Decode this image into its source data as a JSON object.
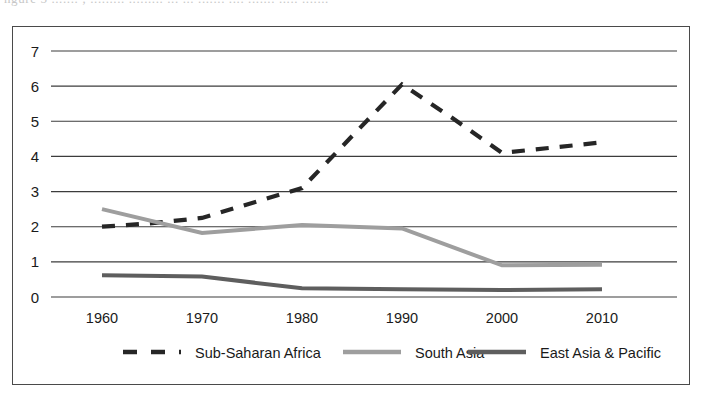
{
  "figure": {
    "caption_remnant": "ngure 5 ....... ; .........  ......... ... ... ....... .... ....... ..... .......",
    "frame_color": "#4a4a4a",
    "background": "#ffffff"
  },
  "chart_data": {
    "type": "line",
    "title": "",
    "subtitle": "",
    "xlabel": "",
    "ylabel": "",
    "x": [
      1960,
      1970,
      1980,
      1990,
      2000,
      2010
    ],
    "categories": [
      "1960",
      "1970",
      "1980",
      "1990",
      "2000",
      "2010"
    ],
    "xlim": [
      1960,
      2010
    ],
    "ylim": [
      0,
      7
    ],
    "yticks": [
      0,
      1,
      2,
      3,
      4,
      5,
      6,
      7
    ],
    "ytick_labels": [
      "0",
      "1",
      "2",
      "3",
      "4",
      "5",
      "6",
      "7"
    ],
    "xticks": [
      1960,
      1970,
      1980,
      1990,
      2000,
      2010
    ],
    "xtick_labels": [
      "1960",
      "1970",
      "1980",
      "1990",
      "2000",
      "2010"
    ],
    "grid": true,
    "grid_axis": "y",
    "grid_color": "#3c3c3c",
    "legend_position": "bottom",
    "series": [
      {
        "name": "Sub-Saharan Africa",
        "style": "dashed",
        "color": "#262626",
        "width": 4.2,
        "x": [
          1960,
          1965,
          1970,
          1980,
          1990,
          1995,
          2000,
          2005,
          2010
        ],
        "values": [
          2.0,
          2.1,
          2.25,
          3.1,
          6.05,
          5.1,
          4.1,
          4.25,
          4.4
        ]
      },
      {
        "name": "South Asia",
        "style": "solid",
        "color": "#9e9e9e",
        "width": 4.0,
        "x": [
          1960,
          1970,
          1980,
          1990,
          2000,
          2010
        ],
        "values": [
          2.5,
          1.82,
          2.05,
          1.95,
          0.9,
          0.92
        ]
      },
      {
        "name": "East Asia & Pacific",
        "style": "solid",
        "color": "#5e5e5e",
        "width": 4.0,
        "x": [
          1960,
          1970,
          1980,
          1990,
          2000,
          2010
        ],
        "values": [
          0.62,
          0.58,
          0.25,
          0.22,
          0.2,
          0.22
        ]
      }
    ]
  },
  "legend": {
    "items": [
      {
        "label": "Sub-Saharan Africa",
        "swatch": "dashed-line-swatch",
        "color": "#262626"
      },
      {
        "label": "South Asia",
        "swatch": "solid-line-swatch",
        "color": "#9e9e9e"
      },
      {
        "label": "East Asia & Pacific",
        "swatch": "solid-line-swatch",
        "color": "#5e5e5e"
      }
    ]
  }
}
